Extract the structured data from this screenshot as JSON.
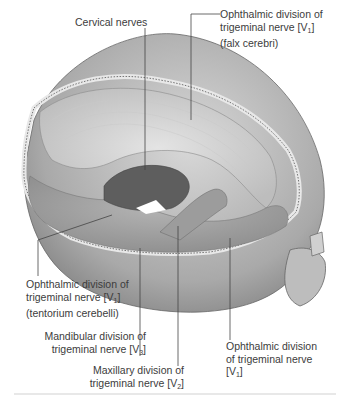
{
  "figure": {
    "labels": [
      {
        "id": "cervical",
        "lines": [
          "Cervical nerves"
        ]
      },
      {
        "id": "v1-falx",
        "lines": [
          "Ophthalmic division of",
          "trigeminal nerve [V",
          "1",
          "]",
          "(falx cerebri)"
        ]
      },
      {
        "id": "v1-tentorium",
        "lines": [
          "Ophthalmic division of",
          "trigeminal nerve [V",
          "1",
          "]",
          "(tentorium cerebelli)"
        ]
      },
      {
        "id": "v3",
        "lines": [
          "Mandibular division of",
          "trigeminal nerve [V",
          "3",
          "]"
        ]
      },
      {
        "id": "v2",
        "lines": [
          "Maxillary division of",
          "trigeminal nerve [V",
          "2",
          "]"
        ]
      },
      {
        "id": "v1",
        "lines": [
          "Ophthalmic division",
          "of  trigeminal nerve",
          "[V",
          "1",
          "]"
        ]
      }
    ]
  }
}
